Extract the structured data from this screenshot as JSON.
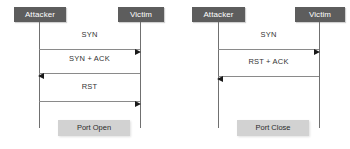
{
  "diagrams": [
    {
      "id": "port-open",
      "actors": {
        "left": "Attacker",
        "right": "Victim"
      },
      "messages": [
        {
          "label": "SYN",
          "direction": "right"
        },
        {
          "label": "SYN + ACK",
          "direction": "left"
        },
        {
          "label": "RST",
          "direction": "right"
        }
      ],
      "status": "Port Open"
    },
    {
      "id": "port-close",
      "actors": {
        "left": "Attacker",
        "right": "Victim"
      },
      "messages": [
        {
          "label": "SYN",
          "direction": "right"
        },
        {
          "label": "RST + ACK",
          "direction": "left"
        }
      ],
      "status": "Port Close"
    }
  ],
  "colors": {
    "actor_box": "#5d5d5d",
    "actor_text": "#ffffff",
    "status_box": "#d2d2d2",
    "status_text": "#2b2b2b",
    "lifeline": "#707070",
    "message_line": "#8a8a8a",
    "arrow_head": "#1a1a1a",
    "background": "#ffffff"
  }
}
